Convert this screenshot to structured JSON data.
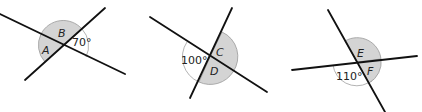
{
  "colors": {
    "line": "#111111",
    "shaded": "#d4d4d4",
    "arc": "#aaaaaa"
  },
  "diagrams": [
    {
      "id": "diagram-1",
      "given_angle": "70°",
      "unknown_labels": [
        "A",
        "B"
      ]
    },
    {
      "id": "diagram-2",
      "given_angle": "100°",
      "unknown_labels": [
        "C",
        "D"
      ]
    },
    {
      "id": "diagram-3",
      "given_angle": "110°",
      "unknown_labels": [
        "E",
        "F"
      ]
    }
  ]
}
